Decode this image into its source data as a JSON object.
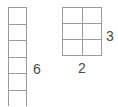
{
  "colors": {
    "background": "#ffffff",
    "line_color": "#9b9b9b",
    "label_color": "#4a4a4a"
  },
  "diagram": {
    "left_strip": {
      "columns": 1,
      "rows": 6,
      "height_label": "6"
    },
    "right_grid": {
      "columns": 2,
      "rows": 3,
      "rows_label": "3",
      "columns_label": "2"
    }
  }
}
